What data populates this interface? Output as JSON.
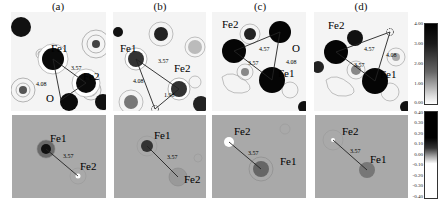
{
  "figure": {
    "panels": [
      {
        "id": "a",
        "label": "(a)"
      },
      {
        "id": "b",
        "label": "(b)"
      },
      {
        "id": "c",
        "label": "(c)"
      },
      {
        "id": "d",
        "label": "(d)"
      }
    ],
    "top_row": {
      "a": {
        "atoms": [
          "Fe1",
          "Fe2",
          "O"
        ],
        "distances": [
          "3.57",
          "4.08"
        ]
      },
      "b": {
        "atoms": [
          "Fe1",
          "Fe2"
        ],
        "distances": [
          "3.57",
          "4.08",
          "1.98"
        ]
      },
      "c": {
        "atoms": [
          "Fe2",
          "O",
          "Fe1"
        ],
        "distances": [
          "4.57",
          "3.57",
          "4.08"
        ]
      },
      "d": {
        "atoms": [
          "Fe2",
          "Fe1"
        ],
        "distances": [
          "4.57",
          "3.57",
          "4.08"
        ]
      }
    },
    "bottom_row": {
      "a": {
        "atoms": [
          "Fe1",
          "Fe2"
        ],
        "distance": "3.57"
      },
      "b": {
        "atoms": [
          "Fe1",
          "Fe2"
        ],
        "distance": "3.57"
      },
      "c": {
        "atoms": [
          "Fe2",
          "Fe1"
        ],
        "distance": "3.57"
      },
      "d": {
        "atoms": [
          "Fe2",
          "Fe1"
        ],
        "distance": "3.57"
      }
    },
    "colorbar_top": {
      "ticks": [
        "4.00",
        "3.00",
        "2.00",
        "1.00",
        "0.00"
      ]
    },
    "colorbar_bottom": {
      "ticks": [
        "0.40",
        "0.30",
        "0.20",
        "0.10",
        "0.00",
        "-0.10",
        "-0.20",
        "-0.30",
        "-0.40"
      ]
    }
  }
}
